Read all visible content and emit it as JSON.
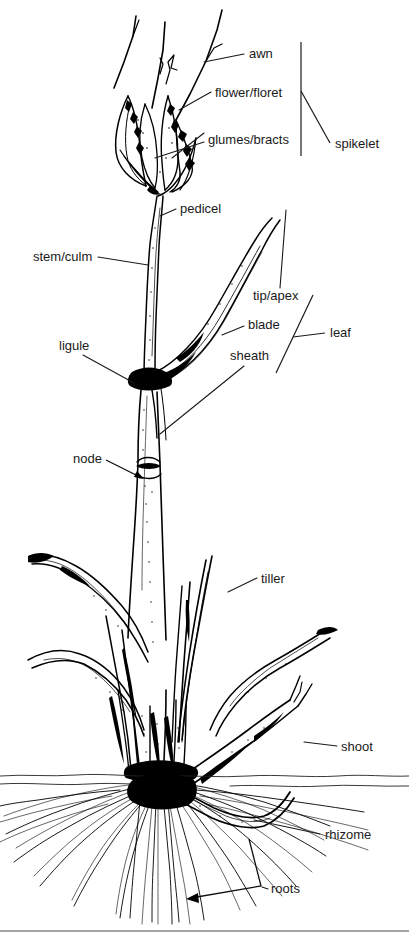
{
  "figure": {
    "style": "line-drawing",
    "ink_color": "#000000",
    "background_color": "#ffffff",
    "text_color": "#1a1a1a"
  },
  "labels": [
    {
      "id": "awn",
      "text": "awn",
      "x": 249,
      "y": 58
    },
    {
      "id": "flower-floret",
      "text": "flower/floret",
      "x": 215,
      "y": 97
    },
    {
      "id": "glumes-bracts",
      "text": "glumes/bracts",
      "x": 208,
      "y": 144
    },
    {
      "id": "spikelet",
      "text": "spikelet",
      "x": 335,
      "y": 148
    },
    {
      "id": "pedicel",
      "text": "pedicel",
      "x": 180,
      "y": 213
    },
    {
      "id": "stem-culm",
      "text": "stem/culm",
      "x": 33,
      "y": 261
    },
    {
      "id": "tip-apex",
      "text": "tip/apex",
      "x": 253,
      "y": 300
    },
    {
      "id": "blade",
      "text": "blade",
      "x": 248,
      "y": 329
    },
    {
      "id": "leaf",
      "text": "leaf",
      "x": 330,
      "y": 337
    },
    {
      "id": "sheath",
      "text": "sheath",
      "x": 230,
      "y": 360
    },
    {
      "id": "ligule",
      "text": "ligule",
      "x": 59,
      "y": 350
    },
    {
      "id": "node",
      "text": "node",
      "x": 73,
      "y": 463
    },
    {
      "id": "tiller",
      "text": "tiller",
      "x": 261,
      "y": 583
    },
    {
      "id": "shoot",
      "text": "shoot",
      "x": 341,
      "y": 751
    },
    {
      "id": "rhizome",
      "text": "rhizome",
      "x": 325,
      "y": 839
    },
    {
      "id": "roots",
      "text": "roots",
      "x": 271,
      "y": 893
    }
  ],
  "brackets": [
    {
      "id": "spikelet-bracket",
      "label": "spikelet",
      "orientation": "vertical",
      "x": 301,
      "y_top": 42,
      "y_bottom": 156
    },
    {
      "id": "leaf-bracket",
      "label": "leaf",
      "orientation": "diagonal",
      "x1": 276,
      "y1": 373,
      "x2": 313,
      "y2": 295
    },
    {
      "id": "roots-bracket",
      "label": "roots",
      "orientation": "angled-arrow"
    }
  ],
  "soil_line": {
    "y": 776,
    "x_start": 0,
    "x_end": 409
  },
  "footer_rule": {
    "y": 931,
    "x_start": 0,
    "x_end": 409
  }
}
